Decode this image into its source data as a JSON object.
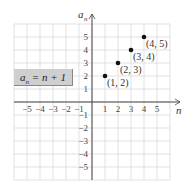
{
  "chart_data": {
    "type": "scatter",
    "title": "",
    "xlabel": "n",
    "ylabel": "a_n",
    "xlim": [
      -6,
      6
    ],
    "ylim": [
      -6,
      6
    ],
    "grid": true,
    "x_ticks": [
      -5,
      -4,
      -3,
      -2,
      -1,
      1,
      2,
      3,
      4,
      5
    ],
    "y_ticks": [
      -5,
      -4,
      -3,
      -2,
      -1,
      1,
      2,
      3,
      4,
      5
    ],
    "series": [
      {
        "name": "a_n = n + 1",
        "points": [
          {
            "x": 1,
            "y": 2,
            "label": "(1, 2)"
          },
          {
            "x": 2,
            "y": 3,
            "label": "(2, 3)"
          },
          {
            "x": 3,
            "y": 4,
            "label": "(3, 4)"
          },
          {
            "x": 4,
            "y": 5,
            "label": "(4, 5)"
          }
        ]
      }
    ],
    "annotations": [
      "a_n = n + 1"
    ]
  },
  "formula": {
    "lhs": "a",
    "sub": "n",
    "rhs": " = n + 1"
  },
  "axes": {
    "x_label": "n",
    "y_label_main": "a",
    "y_label_sub": "n"
  },
  "colors": {
    "grid": "#d9d9d9",
    "axis": "#444444",
    "point": "#111111",
    "formula_bg": "#cfcfcf"
  }
}
